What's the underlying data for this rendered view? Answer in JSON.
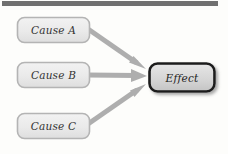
{
  "diagram": {
    "type": "cause-effect",
    "title_bar": {
      "name": "top-divider-bar",
      "color": "#707070",
      "x": 2,
      "y": 1,
      "width": 216,
      "height": 5
    },
    "background_color": "#fdfdfb",
    "nodes": [
      {
        "id": "cause-a",
        "label": "Cause A",
        "role": "cause",
        "x": 17,
        "y": 17,
        "width": 73,
        "height": 26,
        "fill": "#ebebeb",
        "border_color": "#b4b4b4",
        "border_width": 1.6,
        "corner_radius": 7
      },
      {
        "id": "cause-b",
        "label": "Cause B",
        "role": "cause",
        "x": 17,
        "y": 62,
        "width": 73,
        "height": 26,
        "fill": "#ebebeb",
        "border_color": "#b4b4b4",
        "border_width": 1.6,
        "corner_radius": 7
      },
      {
        "id": "cause-c",
        "label": "Cause C",
        "role": "cause",
        "x": 17,
        "y": 113,
        "width": 73,
        "height": 26,
        "fill": "#ebebeb",
        "border_color": "#b4b4b4",
        "border_width": 1.6,
        "corner_radius": 7
      },
      {
        "id": "effect",
        "label": "Effect",
        "role": "effect",
        "x": 149,
        "y": 63,
        "width": 66,
        "height": 29,
        "fill": "#d9d9d9",
        "border_color": "#1a1a1a",
        "border_width": 2.6,
        "corner_radius": 8,
        "shadow": true
      }
    ],
    "edges": [
      {
        "id": "edge-cause-a-to-effect",
        "from": "cause-a",
        "to": "effect",
        "color": "#aeaeae",
        "width": 5,
        "arrowhead": "triangle",
        "x1": 90,
        "y1": 30,
        "x2": 146,
        "y2": 68
      },
      {
        "id": "edge-cause-b-to-effect",
        "from": "cause-b",
        "to": "effect",
        "color": "#aeaeae",
        "width": 5,
        "arrowhead": "triangle",
        "x1": 90,
        "y1": 75,
        "x2": 146,
        "y2": 77
      },
      {
        "id": "edge-cause-c-to-effect",
        "from": "cause-c",
        "to": "effect",
        "color": "#aeaeae",
        "width": 5,
        "arrowhead": "triangle",
        "x1": 90,
        "y1": 125,
        "x2": 146,
        "y2": 88
      }
    ]
  }
}
